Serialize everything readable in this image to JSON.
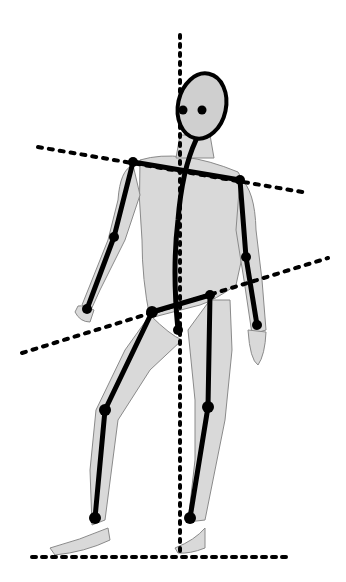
{
  "image": {
    "description": "Pencil sketch of a standing male figure with a black stick-figure skeleton overlay and dotted posture guide lines",
    "colors": {
      "background": "#ffffff",
      "ink": "#000000",
      "shading": "#c8c8c8",
      "outline": "#8a8a8a"
    }
  }
}
